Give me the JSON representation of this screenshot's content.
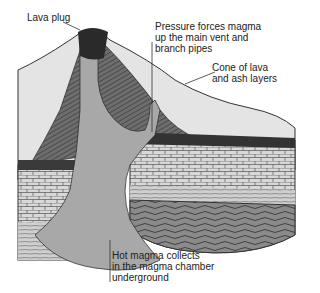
{
  "diagram": {
    "labels": {
      "lava_plug": "Lava plug",
      "pressure": "Pressure forces magma\nup the main vent and\nbranch pipes",
      "cone": "Cone of lava\nand ash layers",
      "chamber": "Hot magma collects\nin the magma chamber\nunderground"
    }
  }
}
